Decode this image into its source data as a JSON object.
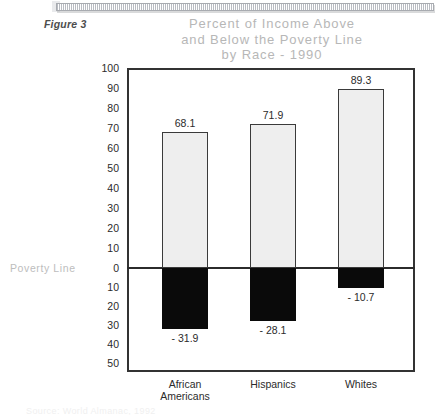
{
  "figure": {
    "label": "Figure 3"
  },
  "title": {
    "line1": "Percent of Income Above",
    "line2": "and Below the Poverty Line",
    "line3": "by Race - 1990"
  },
  "axis": {
    "poverty_line_label": "Poverty Line",
    "y_ticks": [
      "100",
      "90",
      "80",
      "70",
      "60",
      "50",
      "40",
      "30",
      "20",
      "10",
      "0",
      "10",
      "20",
      "30",
      "40",
      "50"
    ]
  },
  "source": {
    "note": "Source: World Almanac, 1992"
  },
  "colors": {
    "bar_above": "#eeeeee",
    "bar_below": "#0a0a0a",
    "frame": "#333333",
    "title_text": "#b7b7b7",
    "axis_text": "#2b2b2b"
  },
  "chart_data": {
    "type": "bar",
    "title": "Percent of Income Above and Below the Poverty Line by Race - 1990",
    "xlabel": "",
    "ylabel": "",
    "ylim": [
      -50,
      100
    ],
    "grid": false,
    "legend": false,
    "categories": [
      "African Americans",
      "Hispanics",
      "Whites"
    ],
    "category_lines": [
      [
        "African",
        "Americans"
      ],
      [
        "Hispanics"
      ],
      [
        "Whites"
      ]
    ],
    "series": [
      {
        "name": "Above Poverty Line",
        "values": [
          68.1,
          71.9,
          89.3
        ],
        "labels": [
          "68.1",
          "71.9",
          "89.3"
        ]
      },
      {
        "name": "Below Poverty Line",
        "values": [
          -31.9,
          -28.1,
          -10.7
        ],
        "labels": [
          "- 31.9",
          "- 28.1",
          "- 10.7"
        ]
      }
    ],
    "annotations": [
      "Poverty Line"
    ]
  }
}
